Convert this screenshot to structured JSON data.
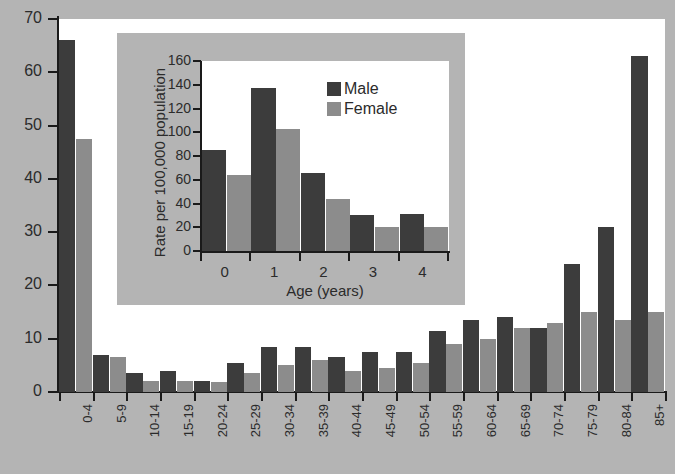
{
  "chart_data": [
    {
      "id": "main",
      "type": "bar",
      "title": "",
      "xlabel": "",
      "ylabel": "",
      "ylim": [
        0,
        70
      ],
      "yticks": [
        0,
        10,
        20,
        30,
        40,
        50,
        60,
        70
      ],
      "grid": false,
      "legend_position": "inset",
      "categories": [
        "0-4",
        "5-9",
        "10-14",
        "15-19",
        "20-24",
        "25-29",
        "30-34",
        "35-39",
        "40-44",
        "45-49",
        "50-54",
        "55-59",
        "60-64",
        "65-69",
        "70-74",
        "75-79",
        "80-84",
        "85+"
      ],
      "series": [
        {
          "name": "Male",
          "color": "#3c3c3c",
          "values": [
            66,
            7,
            3.5,
            4,
            2,
            5.5,
            8.5,
            8.5,
            6.5,
            7.5,
            7.5,
            11.5,
            13.5,
            14,
            12,
            24,
            31,
            63
          ]
        },
        {
          "name": "Female",
          "color": "#8c8c8c",
          "values": [
            47.5,
            6.5,
            2,
            2,
            1.8,
            3.5,
            5,
            6,
            4,
            4.5,
            5.5,
            9,
            10,
            12,
            13,
            15,
            13.5,
            15
          ]
        }
      ]
    },
    {
      "id": "inset",
      "type": "bar",
      "title": "",
      "xlabel": "Age (years)",
      "ylabel": "Rate per 100,000 population",
      "ylim": [
        0,
        160
      ],
      "yticks": [
        0,
        20,
        40,
        60,
        80,
        100,
        120,
        140,
        160
      ],
      "grid": false,
      "legend_position": "upper-right",
      "categories": [
        "0",
        "1",
        "2",
        "3",
        "4"
      ],
      "series": [
        {
          "name": "Male",
          "color": "#3c3c3c",
          "values": [
            85,
            137,
            66,
            30,
            31
          ]
        },
        {
          "name": "Female",
          "color": "#8c8c8c",
          "values": [
            64,
            103,
            44,
            20,
            20
          ]
        }
      ]
    }
  ],
  "main": {
    "yticks": [
      "0",
      "10",
      "20",
      "30",
      "40",
      "50",
      "60",
      "70"
    ],
    "xticks": [
      "0-4",
      "5-9",
      "10-14",
      "15-19",
      "20-24",
      "25-29",
      "30-34",
      "35-39",
      "40-44",
      "45-49",
      "50-54",
      "55-59",
      "60-64",
      "65-69",
      "70-74",
      "75-79",
      "80-84",
      "85+"
    ]
  },
  "inset": {
    "ylabel": "Rate per 100,000 population",
    "xlabel": "Age (years)",
    "yticks": [
      "0",
      "20",
      "40",
      "60",
      "80",
      "100",
      "120",
      "140",
      "160"
    ],
    "xticks": [
      "0",
      "1",
      "2",
      "3",
      "4"
    ],
    "legend": [
      {
        "label": "Male",
        "color": "#3c3c3c",
        "swatch": "male-swatch-icon"
      },
      {
        "label": "Female",
        "color": "#8c8c8c",
        "swatch": "female-swatch-icon"
      }
    ]
  },
  "colors": {
    "male": "#3c3c3c",
    "female": "#8c8c8c",
    "frame": "#b4b4b4",
    "axis": "#1a1a1a",
    "text": "#2b2b2b",
    "plot_background": "#ffffff"
  }
}
